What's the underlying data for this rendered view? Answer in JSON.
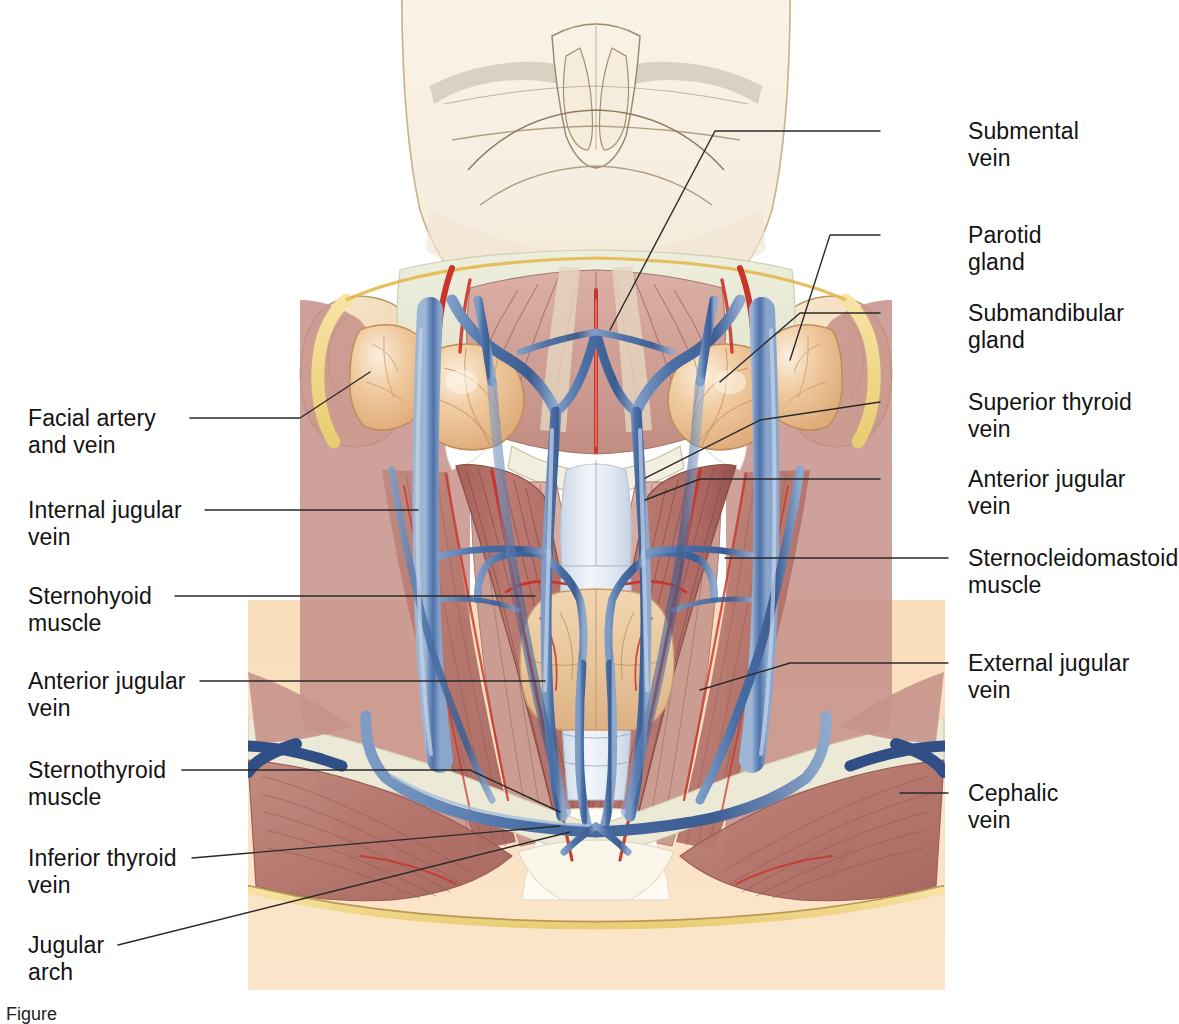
{
  "figure": {
    "caption": "Figure",
    "background_color": "#ffffff",
    "panel": {
      "x": 248,
      "y": 0,
      "width": 697,
      "height": 990,
      "skin_face_color": "#f7f0e3",
      "skin_chest_color": "#fae0c0",
      "muscle_color": "#b5766d",
      "muscle_pale_color": "#d9a99c",
      "vein_color": "#4a6fa5",
      "vein_dark_color": "#39548a",
      "artery_color": "#c8352b",
      "gland_color": "#edc49b",
      "thyroid_color": "#e9c8a0",
      "trachea_color": "#dfe6ef",
      "fat_color": "#f2d98a",
      "fascia_color": "#e6e6d2"
    }
  },
  "labels_left": [
    {
      "id": "facial-artery-and-vein",
      "text": "Facial artery\nand vein",
      "x": 28,
      "y": 405,
      "leader": [
        [
          190,
          418
        ],
        [
          300,
          418
        ],
        [
          370,
          372
        ]
      ]
    },
    {
      "id": "internal-jugular-vein",
      "text": "Internal jugular\nvein",
      "x": 28,
      "y": 497,
      "leader": [
        [
          205,
          510
        ],
        [
          418,
          510
        ]
      ]
    },
    {
      "id": "sternohyoid-muscle",
      "text": "Sternohyoid\nmuscle",
      "x": 28,
      "y": 583,
      "leader": [
        [
          175,
          596
        ],
        [
          535,
          596
        ]
      ]
    },
    {
      "id": "anterior-jugular-vein-l",
      "text": "Anterior jugular\nvein",
      "x": 28,
      "y": 668,
      "leader": [
        [
          200,
          681
        ],
        [
          545,
          681
        ]
      ]
    },
    {
      "id": "sternothyroid-muscle",
      "text": "Sternothyroid\nmuscle",
      "x": 28,
      "y": 757,
      "leader": [
        [
          182,
          770
        ],
        [
          470,
          770
        ],
        [
          560,
          812
        ]
      ]
    },
    {
      "id": "inferior-thyroid-vein",
      "text": "Inferior thyroid\nvein",
      "x": 28,
      "y": 845,
      "leader": [
        [
          192,
          858
        ],
        [
          560,
          826
        ]
      ]
    },
    {
      "id": "jugular-arch",
      "text": "Jugular\narch",
      "x": 28,
      "y": 932,
      "leader": [
        [
          118,
          945
        ],
        [
          570,
          832
        ]
      ]
    }
  ],
  "labels_right": [
    {
      "id": "submental-vein",
      "text": "Submental\nvein",
      "x": 968,
      "y": 118,
      "leader": [
        [
          880,
          131
        ],
        [
          715,
          131
        ],
        [
          610,
          330
        ]
      ]
    },
    {
      "id": "parotid-gland",
      "text": "Parotid\ngland",
      "x": 968,
      "y": 222,
      "leader": [
        [
          880,
          235
        ],
        [
          830,
          235
        ],
        [
          790,
          360
        ]
      ]
    },
    {
      "id": "submandibular-gland",
      "text": "Submandibular\ngland",
      "x": 968,
      "y": 300,
      "leader": [
        [
          880,
          313
        ],
        [
          800,
          313
        ],
        [
          720,
          382
        ]
      ]
    },
    {
      "id": "superior-thyroid-vein",
      "text": "Superior thyroid\nvein",
      "x": 968,
      "y": 389,
      "leader": [
        [
          880,
          402
        ],
        [
          760,
          420
        ],
        [
          645,
          478
        ]
      ]
    },
    {
      "id": "anterior-jugular-vein-r",
      "text": "Anterior jugular\nvein",
      "x": 968,
      "y": 466,
      "leader": [
        [
          880,
          479
        ],
        [
          700,
          479
        ],
        [
          645,
          500
        ]
      ]
    },
    {
      "id": "sternocleidomastoid-muscle",
      "text": "Sternocleidomastoid\nmuscle",
      "x": 968,
      "y": 545,
      "leader": [
        [
          948,
          558
        ],
        [
          725,
          558
        ]
      ]
    },
    {
      "id": "external-jugular-vein",
      "text": "External jugular\nvein",
      "x": 968,
      "y": 650,
      "leader": [
        [
          948,
          663
        ],
        [
          790,
          663
        ],
        [
          700,
          690
        ]
      ]
    },
    {
      "id": "cephalic-vein",
      "text": "Cephalic\nvein",
      "x": 968,
      "y": 780,
      "leader": [
        [
          948,
          793
        ],
        [
          900,
          793
        ]
      ]
    }
  ]
}
